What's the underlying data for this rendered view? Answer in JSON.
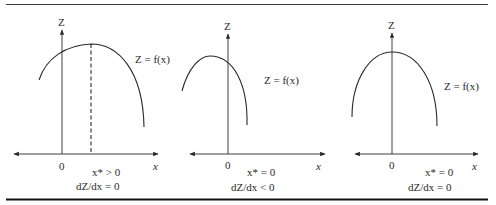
{
  "colors": {
    "ink": "#2a2a2a",
    "background": "#ffffff"
  },
  "panels": [
    {
      "z_axis_label": "Z",
      "x_axis_label": "x",
      "origin_label": "0",
      "function_label": "Z = f(x)",
      "condition_1": "x* > 0",
      "condition_2": "dZ/dx = 0",
      "has_dashed_line": true
    },
    {
      "z_axis_label": "Z",
      "x_axis_label": "x",
      "origin_label": "0",
      "function_label": "Z = f(x)",
      "condition_1": "x* = 0",
      "condition_2": "dZ/dx < 0",
      "has_dashed_line": false
    },
    {
      "z_axis_label": "Z",
      "x_axis_label": "x",
      "origin_label": "0",
      "function_label": "Z = f(x)",
      "condition_1": "x* = 0",
      "condition_2": "dZ/dx = 0",
      "has_dashed_line": false
    }
  ]
}
